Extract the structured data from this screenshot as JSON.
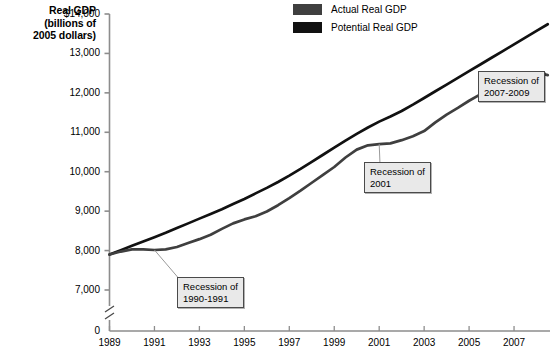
{
  "axis_title": {
    "line1": "Real GDP",
    "line2": "(billions of",
    "line3": "2005 dollars)"
  },
  "legend": {
    "items": [
      {
        "label": "Actual Real GDP",
        "color": "#3f3f3f",
        "name": "actual-real-gdp"
      },
      {
        "label": "Potential Real GDP",
        "color": "#111111",
        "name": "potential-real-gdp"
      }
    ]
  },
  "y_ticks": [
    {
      "label": "$14,000",
      "value": 14000
    },
    {
      "label": "13,000",
      "value": 13000
    },
    {
      "label": "12,000",
      "value": 12000
    },
    {
      "label": "11,000",
      "value": 11000
    },
    {
      "label": "10,000",
      "value": 10000
    },
    {
      "label": "9,000",
      "value": 9000
    },
    {
      "label": "8,000",
      "value": 8000
    },
    {
      "label": "7,000",
      "value": 7000
    },
    {
      "label": "0",
      "value": 0
    }
  ],
  "x_ticks": [
    {
      "label": "1989",
      "value": 1989
    },
    {
      "label": "1991",
      "value": 1991
    },
    {
      "label": "1993",
      "value": 1993
    },
    {
      "label": "1995",
      "value": 1995
    },
    {
      "label": "1997",
      "value": 1997
    },
    {
      "label": "1999",
      "value": 1999
    },
    {
      "label": "2001",
      "value": 2001
    },
    {
      "label": "2003",
      "value": 2003
    },
    {
      "label": "2005",
      "value": 2005
    },
    {
      "label": "2007",
      "value": 2007
    }
  ],
  "callouts": [
    {
      "name": "recession-1990-1991",
      "line1": "Recession of",
      "line2": "1990-1991"
    },
    {
      "name": "recession-2001",
      "line1": "Recession of",
      "line2": "2001"
    },
    {
      "name": "recession-2007-2009",
      "line1": "Recession of",
      "line2": "2007-2009"
    }
  ],
  "chart_data": {
    "type": "line",
    "title": "",
    "xlabel": "",
    "ylabel": "Real GDP (billions of 2005 dollars)",
    "xlim": [
      1989,
      2008.6
    ],
    "ylim": [
      7000,
      14000
    ],
    "axis_break": true,
    "axis_break_from": 0,
    "axis_break_to": 7000,
    "grid": false,
    "legend_position": "top-center",
    "x": [
      1989,
      1989.5,
      1990,
      1990.5,
      1991,
      1991.5,
      1992,
      1992.5,
      1993,
      1993.5,
      1994,
      1994.5,
      1995,
      1995.5,
      1996,
      1996.5,
      1997,
      1997.5,
      1998,
      1998.5,
      1999,
      1999.5,
      2000,
      2000.5,
      2001,
      2001.5,
      2002,
      2002.5,
      2003,
      2003.5,
      2004,
      2004.5,
      2005,
      2005.5,
      2006,
      2006.5,
      2007,
      2007.5,
      2008,
      2008.5
    ],
    "series": [
      {
        "name": "Actual Real GDP",
        "color": "#3f3f3f",
        "values": [
          7900,
          7975,
          8030,
          8030,
          8015,
          8030,
          8090,
          8190,
          8290,
          8400,
          8550,
          8690,
          8790,
          8870,
          8990,
          9150,
          9330,
          9520,
          9720,
          9920,
          10120,
          10360,
          10560,
          10670,
          10700,
          10720,
          10800,
          10900,
          11030,
          11250,
          11450,
          11620,
          11800,
          11960,
          12130,
          12270,
          12400,
          12490,
          12520,
          12450
        ]
      },
      {
        "name": "Potential Real GDP",
        "color": "#111111",
        "values": [
          7900,
          8010,
          8120,
          8230,
          8340,
          8450,
          8570,
          8690,
          8810,
          8930,
          9050,
          9180,
          9310,
          9450,
          9590,
          9740,
          9900,
          10070,
          10250,
          10430,
          10610,
          10790,
          10960,
          11120,
          11270,
          11400,
          11540,
          11700,
          11870,
          12040,
          12210,
          12380,
          12550,
          12720,
          12890,
          13060,
          13230,
          13400,
          13570,
          13740
        ]
      }
    ],
    "annotations": [
      {
        "text": "Recession of 1990-1991",
        "points_to_x": 1991.0,
        "points_to_y": 8015
      },
      {
        "text": "Recession of 2001",
        "points_to_x": 2001.0,
        "points_to_y": 10700
      },
      {
        "text": "Recession of 2007-2009",
        "points_to_x": 2008.0,
        "points_to_y": 12520
      }
    ]
  }
}
